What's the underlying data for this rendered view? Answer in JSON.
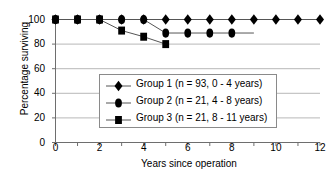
{
  "chart_data": {
    "type": "line",
    "title": "",
    "xlabel": "Years since operation",
    "ylabel": "Percentage surviving",
    "xlim": [
      0,
      12
    ],
    "ylim": [
      0,
      100
    ],
    "xticks": [
      0,
      1,
      2,
      3,
      4,
      5,
      6,
      7,
      8,
      9,
      10,
      11,
      12
    ],
    "xtick_labels": [
      "0",
      "",
      "2",
      "",
      "4",
      "",
      "6",
      "",
      "8",
      "",
      "10",
      "",
      "12"
    ],
    "yticks": [
      0,
      20,
      40,
      60,
      80,
      100
    ],
    "ytick_labels": [
      "0",
      "20",
      "40",
      "60",
      "80",
      "100"
    ],
    "grid": "horizontal",
    "legend_position": "lower-center-inside",
    "series": [
      {
        "name": "Group 1 (n = 93, 0 - 4 years)",
        "marker": "diamond",
        "color": "#000000",
        "x": [
          0,
          1,
          2,
          3,
          4,
          5,
          6,
          7,
          8,
          9,
          10,
          11,
          12
        ],
        "values": [
          100,
          100,
          100,
          100,
          100,
          100,
          100,
          100,
          100,
          100,
          100,
          100,
          100
        ]
      },
      {
        "name": "Group 2 (n = 21, 4 - 8 years)",
        "marker": "circle",
        "color": "#000000",
        "x": [
          0,
          1,
          2,
          3,
          4,
          5,
          6,
          7,
          8
        ],
        "values": [
          100,
          100,
          100,
          100,
          100,
          89,
          89,
          89,
          89
        ],
        "line_extends_to_x": 9
      },
      {
        "name": "Group 3 (n = 21, 8 - 11 years)",
        "marker": "square",
        "color": "#000000",
        "x": [
          0,
          1,
          2,
          3,
          4,
          5
        ],
        "values": [
          100,
          100,
          100,
          91,
          86,
          80
        ]
      }
    ]
  },
  "axes": {
    "ylabel": "Percentage surviving",
    "xlabel": "Years since operation"
  },
  "legend": {
    "entries": [
      {
        "label": "Group 1 (n = 93, 0 - 4 years)",
        "marker": "diamond"
      },
      {
        "label": "Group 2 (n = 21, 4 - 8 years)",
        "marker": "circle"
      },
      {
        "label": "Group 3 (n = 21, 8 - 11 years)",
        "marker": "square"
      }
    ]
  }
}
